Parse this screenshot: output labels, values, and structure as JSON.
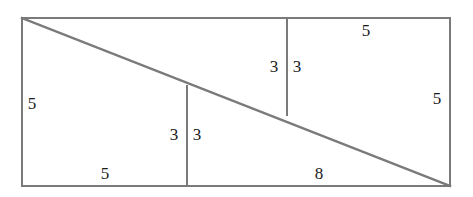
{
  "figure": {
    "type": "geometry-diagram",
    "background_color": "#ffffff",
    "stroke_color": "#7a7a7a",
    "label_color": "#1a1a1a",
    "stroke_width": 2
  },
  "geometry": {
    "frame": {
      "left": 22,
      "top": 18,
      "right": 450,
      "bottom": 186
    },
    "diagonal": {
      "x1": 22,
      "y1": 18,
      "x2": 450,
      "y2": 186
    },
    "vertical_upper": {
      "x": 287,
      "y1": 18,
      "y2": 115
    },
    "vertical_lower": {
      "x": 187,
      "y1": 86,
      "y2": 186
    }
  },
  "labels": [
    {
      "id": "left-side-length",
      "text": "5",
      "x": 32,
      "y": 103
    },
    {
      "id": "top-right-segment-length",
      "text": "5",
      "x": 366,
      "y": 30
    },
    {
      "id": "right-side-length",
      "text": "5",
      "x": 437,
      "y": 98
    },
    {
      "id": "bottom-left-segment-length",
      "text": "5",
      "x": 105,
      "y": 173
    },
    {
      "id": "bottom-right-segment-length",
      "text": "8",
      "x": 319,
      "y": 173
    },
    {
      "id": "upper-step-left-height",
      "text": "3",
      "x": 274,
      "y": 66
    },
    {
      "id": "upper-step-right-height",
      "text": "3",
      "x": 297,
      "y": 66
    },
    {
      "id": "lower-step-left-height",
      "text": "3",
      "x": 174,
      "y": 134
    },
    {
      "id": "lower-step-right-height",
      "text": "3",
      "x": 197,
      "y": 134
    }
  ]
}
